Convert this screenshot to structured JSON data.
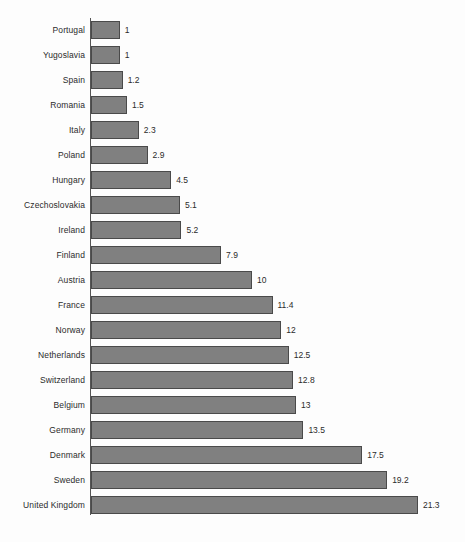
{
  "chart_data": {
    "type": "bar",
    "orientation": "horizontal",
    "title": "",
    "subtitle": "",
    "xlabel": "",
    "ylabel": "",
    "legend": [],
    "grid": false,
    "xlim": [
      0,
      21.3
    ],
    "categories": [
      "Portugal",
      "Yugoslavia",
      "Spain",
      "Romania",
      "Italy",
      "Poland",
      "Hungary",
      "Czechoslovakia",
      "Ireland",
      "Finland",
      "Austria",
      "France",
      "Norway",
      "Netherlands",
      "Switzerland",
      "Belgium",
      "Germany",
      "Denmark",
      "Sweden",
      "United Kingdom"
    ],
    "values": [
      1,
      1,
      1.2,
      1.5,
      2.3,
      2.9,
      4.5,
      5.1,
      5.2,
      7.9,
      10,
      11.4,
      12,
      12.5,
      12.8,
      13,
      13.5,
      17.5,
      19.2,
      21.3
    ],
    "value_labels": [
      "1",
      "1",
      "1.2",
      "1.5",
      "2.3",
      "2.9",
      "4.5",
      "5.1",
      "5.2",
      "7.9",
      "10",
      "11.4",
      "12",
      "12.5",
      "12.8",
      "13",
      "13.5",
      "17.5",
      "19.2",
      "21.3"
    ],
    "bar_color": "#808080",
    "bar_border_color": "#4a4a4a",
    "axis_color": "#555555",
    "background_color": "#fdfdfd",
    "text_color": "#2b2b2b"
  }
}
